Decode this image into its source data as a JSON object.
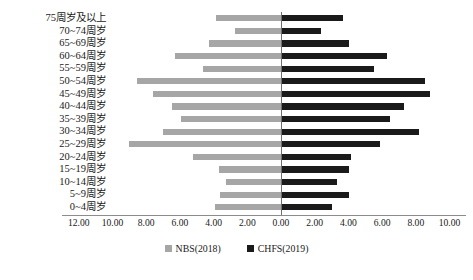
{
  "chart_data": {
    "type": "bar",
    "subtype": "population-pyramid",
    "title": "",
    "xlabel": "",
    "ylabel": "",
    "orientation": "horizontal",
    "grid": false,
    "legend_position": "bottom",
    "axis_zero_label": "0.00",
    "categories": [
      "75周岁及以上",
      "70~74周岁",
      "65~69周岁",
      "60~64周岁",
      "55~59周岁",
      "50~54周岁",
      "45~49周岁",
      "40~44周岁",
      "35~39周岁",
      "30~34周岁",
      "25~29周岁",
      "20~24周岁",
      "15~19周岁",
      "10~14周岁",
      "5~9周岁",
      "0~4周岁"
    ],
    "xtick_labels": [
      "12.00",
      "10.00",
      "8.00",
      "6.00",
      "4.00",
      "2.00",
      "0.00",
      "2.00",
      "4.00",
      "6.00",
      "8.00",
      "10.00"
    ],
    "xtick_values": [
      -12,
      -10,
      -8,
      -6,
      -4,
      -2,
      0,
      2,
      4,
      6,
      8,
      10
    ],
    "xlim": [
      -12,
      10
    ],
    "series": [
      {
        "name": "NBS(2018)",
        "color": "#a6a6a6",
        "side": "left",
        "values": [
          3.85,
          2.75,
          4.25,
          6.3,
          4.65,
          8.55,
          7.6,
          6.45,
          5.95,
          7.0,
          9.05,
          5.25,
          3.65,
          3.25,
          3.6,
          3.9
        ]
      },
      {
        "name": "CHFS(2019)",
        "color": "#1a1a1a",
        "side": "right",
        "values": [
          3.7,
          2.35,
          4.05,
          6.3,
          5.5,
          8.55,
          8.85,
          7.3,
          6.45,
          8.2,
          5.85,
          4.15,
          4.05,
          3.3,
          4.05,
          3.05
        ]
      }
    ],
    "legend": [
      {
        "label": "NBS(2018)",
        "color": "#a6a6a6"
      },
      {
        "label": "CHFS(2019)",
        "color": "#1a1a1a"
      }
    ]
  },
  "caption": ""
}
